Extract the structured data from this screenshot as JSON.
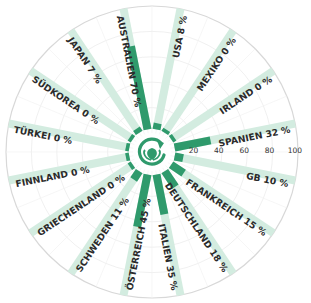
{
  "chart_data": {
    "type": "bar",
    "subtype": "radial-bar",
    "title": "",
    "xlabel": "",
    "ylabel": "",
    "ylim": [
      0,
      100
    ],
    "axis_ticks": [
      "20",
      "40",
      "60",
      "80",
      "100"
    ],
    "grid": true,
    "legend": null,
    "categories": [
      "USA",
      "MEXIKO",
      "IRLAND",
      "SPANIEN",
      "GB",
      "FRANKREICH",
      "DEUTSCHLAND",
      "ITALIEN",
      "ÖSTERREICH",
      "SCHWEDEN",
      "GRIECHENLAND",
      "FINNLAND",
      "TÜRKEI",
      "SÜDKOREA",
      "JAPAN",
      "AUSTRALIEN"
    ],
    "values": [
      8,
      0,
      0,
      32,
      10,
      15,
      18,
      35,
      45,
      11,
      0,
      0,
      0,
      0,
      7,
      70
    ],
    "labels": [
      "USA 8 %",
      "MEXIKO 0 %",
      "IRLAND 0 %",
      "SPANIEN 32 %",
      "GB 10 %",
      "FRANKREICH 15 %",
      "DEUTSCHLAND 18 %",
      "ITALIEN 35 %",
      "ÖSTERREICH 45 %",
      "SCHWEDEN 11 %",
      "GRIECHENLAND 0 %",
      "FINNLAND 0 %",
      "TÜRKEI 0 %",
      "SÜDKOREA 0 %",
      "JAPAN 7 %",
      "AUSTRALIEN 70 %"
    ],
    "unit": "%"
  },
  "colors": {
    "bar": "#2f9a6c",
    "track": "#d3ece0",
    "grid": "#e6e6e6",
    "outline": "#d8d8d8",
    "icon": "#2f9a6c"
  },
  "center_icon": "recycle-leaf-icon"
}
